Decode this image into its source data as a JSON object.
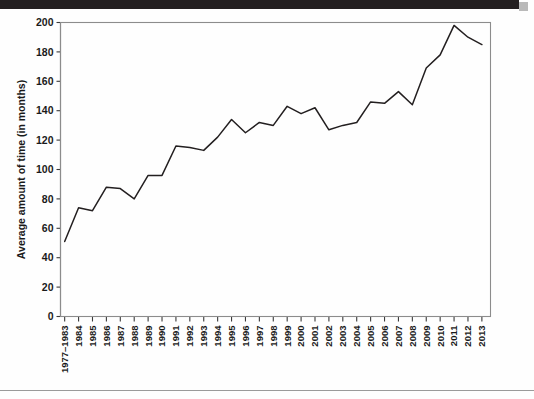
{
  "page": {
    "background_color": "#fefefe",
    "top_bar_color": "#231f20",
    "rule_color": "#9a9a9a"
  },
  "chart_data": {
    "type": "line",
    "title": "",
    "subtitle": "",
    "xlabel": "",
    "ylabel": "Average amount of time (in months)",
    "ylim": [
      0,
      200
    ],
    "ytick_step": 20,
    "yticks": [
      0,
      20,
      40,
      60,
      80,
      100,
      120,
      140,
      160,
      180,
      200
    ],
    "grid": false,
    "legend": false,
    "legend_position": "none",
    "line_color": "#231f20",
    "axis_color": "#3a3a3a",
    "frame_color": "#8c8c8c",
    "categories": [
      "1977–1983",
      "1984",
      "1985",
      "1986",
      "1987",
      "1988",
      "1989",
      "1990",
      "1991",
      "1992",
      "1993",
      "1994",
      "1995",
      "1996",
      "1997",
      "1998",
      "1999",
      "2000",
      "2001",
      "2002",
      "2003",
      "2004",
      "2005",
      "2006",
      "2007",
      "2008",
      "2009",
      "2010",
      "2011",
      "2012",
      "2013"
    ],
    "values": [
      51,
      74,
      72,
      88,
      87,
      80,
      96,
      96,
      116,
      115,
      113,
      122,
      134,
      125,
      132,
      130,
      143,
      138,
      142,
      127,
      130,
      132,
      146,
      145,
      153,
      144,
      169,
      178,
      198,
      190,
      185
    ],
    "series": [
      {
        "name": "Average amount of time (in months)",
        "values": [
          51,
          74,
          72,
          88,
          87,
          80,
          96,
          96,
          116,
          115,
          113,
          122,
          134,
          125,
          132,
          130,
          143,
          138,
          142,
          127,
          130,
          132,
          146,
          145,
          153,
          144,
          169,
          178,
          198,
          190,
          185
        ]
      }
    ]
  }
}
